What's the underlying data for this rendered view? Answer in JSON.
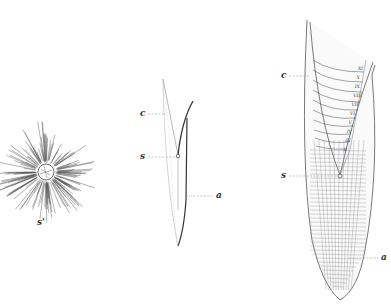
{
  "figure": {
    "type": "botanical illustration",
    "panels": [
      {
        "id": "left",
        "description": "radiating cell mass (cross-section)",
        "labels": [
          {
            "text": "s'",
            "x": 37,
            "y": 222
          }
        ]
      },
      {
        "id": "middle",
        "description": "outline of root tip with leader lines",
        "labels": [
          {
            "text": "c",
            "x": 141,
            "y": 115
          },
          {
            "text": "s",
            "x": 141,
            "y": 154
          },
          {
            "text": "a",
            "x": 217,
            "y": 197
          }
        ]
      },
      {
        "id": "right",
        "description": "detailed longitudinal section of root tip with cell layers",
        "labels": [
          {
            "text": "c",
            "x": 282,
            "y": 76
          },
          {
            "text": "s",
            "x": 282,
            "y": 174
          },
          {
            "text": "a",
            "x": 383,
            "y": 258
          }
        ],
        "layer_marks": [
          "I",
          "II",
          "III",
          "IV",
          "V",
          "VI",
          "VII",
          "VIII",
          "IX",
          "X",
          "XI"
        ]
      }
    ]
  }
}
